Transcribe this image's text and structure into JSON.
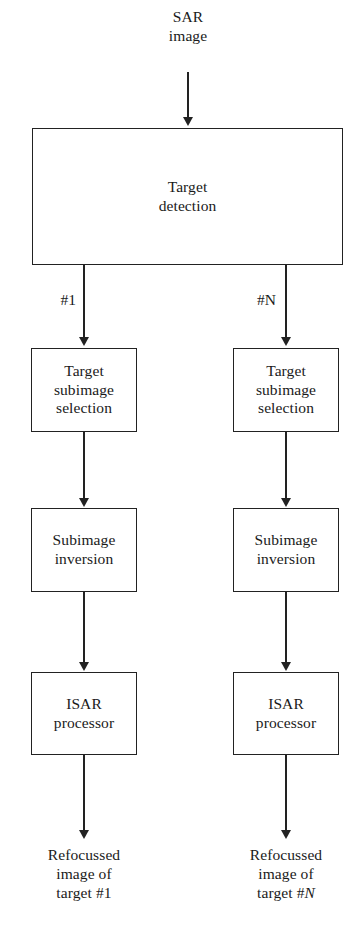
{
  "diagram": {
    "background_color": "#ffffff",
    "line_color": "#222222",
    "text_color": "#1a1a1a"
  },
  "input": {
    "label": "SAR\nimage"
  },
  "detection": {
    "label": "Target\ndetection"
  },
  "branches": {
    "left_label": "#1",
    "right_label_prefix": "#",
    "right_label_italic": "N"
  },
  "left_chain": {
    "step1": "Target\nsubimage\nselection",
    "step2": "Subimage\ninversion",
    "step3": "ISAR\nprocessor",
    "output_line1": "Refocussed",
    "output_line2": "image of",
    "output_line3_prefix": "target #",
    "output_line3_suffix": "1"
  },
  "right_chain": {
    "step1": "Target\nsubimage\nselection",
    "step2": "Subimage\ninversion",
    "step3": "ISAR\nprocessor",
    "output_line1": "Refocussed",
    "output_line2": "image of",
    "output_line3_prefix": "target #",
    "output_line3_suffix": "N"
  }
}
